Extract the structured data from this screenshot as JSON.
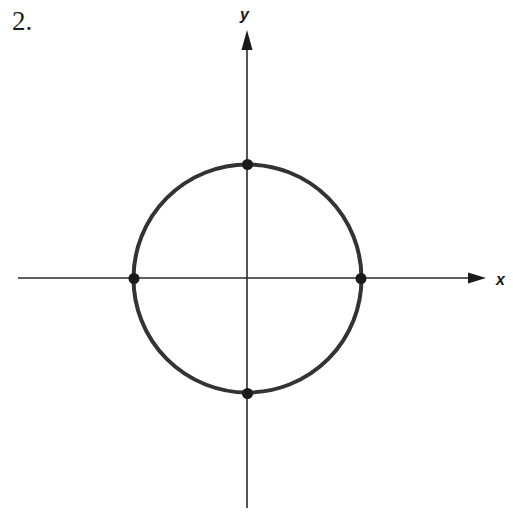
{
  "problem": {
    "number": "2."
  },
  "axes": {
    "x_label": "x",
    "y_label": "y",
    "color": "#1a1a1a"
  },
  "figure": {
    "type": "circle-on-axes",
    "circle": {
      "center": [
        0,
        0
      ],
      "radius": 1,
      "stroke_color": "#333333"
    },
    "points": [
      {
        "name": "top",
        "coords": [
          0,
          1
        ]
      },
      {
        "name": "bottom",
        "coords": [
          0,
          -1
        ]
      },
      {
        "name": "left",
        "coords": [
          -1,
          0
        ]
      },
      {
        "name": "right",
        "coords": [
          1,
          0
        ]
      }
    ]
  }
}
